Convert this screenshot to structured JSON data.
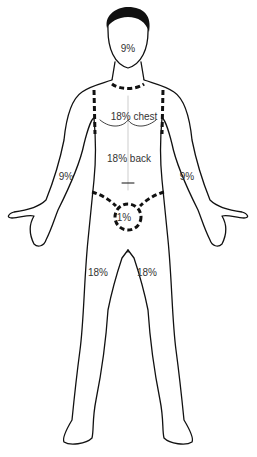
{
  "diagram": {
    "labels": {
      "head": "9%",
      "chest": "18% chest",
      "back": "18% back",
      "arm_right": "9%",
      "arm_left": "9%",
      "genitals": "1%",
      "leg_right": "18%",
      "leg_left": "18%"
    }
  }
}
